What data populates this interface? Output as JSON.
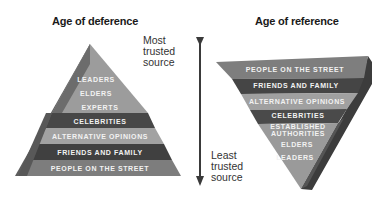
{
  "diagram": {
    "left": {
      "title": "Age of deference",
      "shape": "pyramid",
      "levels_top_to_bottom": [
        "LEADERS",
        "ELDERS",
        "EXPERTS",
        "CELEBRITIES",
        "ALTERNATIVE OPINIONS",
        "FRIENDS AND FAMILY",
        "PEOPLE ON THE STREET"
      ]
    },
    "right": {
      "title": "Age of reference",
      "shape": "inverted-pyramid",
      "levels_top_to_bottom": [
        "PEOPLE ON THE STREET",
        "FRIENDS AND FAMILY",
        "ALTERNATIVE OPINIONS",
        "CELEBRITIES",
        "ESTABLISHED",
        "AUTHORITIES",
        "ELDERS",
        "LEADERS"
      ]
    },
    "axis": {
      "top_label": [
        "Most",
        "trusted",
        "source"
      ],
      "bottom_label": [
        "Least",
        "trusted",
        "source"
      ],
      "direction": "down"
    },
    "colors": {
      "light": "#9a9a9a",
      "medium": "#7a7a7a",
      "dark": "#3e3e3e",
      "side": "#5a5a5a"
    }
  }
}
